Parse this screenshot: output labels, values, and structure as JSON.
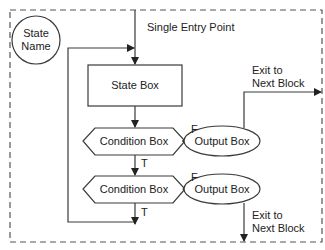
{
  "diagram": {
    "colors": {
      "stroke": "#3a3a3a",
      "text": "#222222",
      "background": "#ffffff",
      "border_dash": "#555555"
    },
    "state_name": {
      "line1": "State",
      "line2": "Name"
    },
    "entry_label": "Single Entry Point",
    "state_box": {
      "label": "State Box"
    },
    "condition_boxes": [
      {
        "label": "Condition Box",
        "true_label": "T",
        "false_label": "F"
      },
      {
        "label": "Condition Box",
        "true_label": "T",
        "false_label": "F"
      }
    ],
    "output_boxes": [
      {
        "label": "Output Box"
      },
      {
        "label": "Output Box"
      }
    ],
    "exits": [
      {
        "line1": "Exit to",
        "line2": "Next Block"
      },
      {
        "line1": "Exit to",
        "line2": "Next Block"
      }
    ]
  }
}
